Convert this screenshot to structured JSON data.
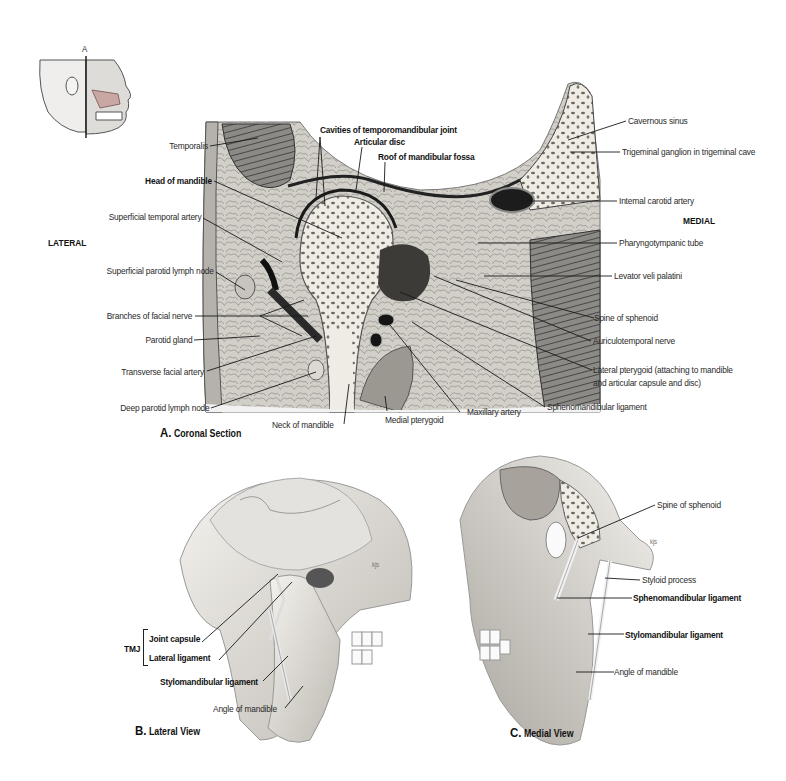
{
  "orientation_figure": {
    "plane_label": "A"
  },
  "panel_a": {
    "caption_letter": "A.",
    "caption_text": "Coronal Section",
    "side_labels": {
      "lateral": "LATERAL",
      "medial": "MEDIAL"
    },
    "labels_left": [
      {
        "text": "Temporalis",
        "bold": false
      },
      {
        "text": "Head of mandible",
        "bold": true
      },
      {
        "text": "Superficial temporal artery",
        "bold": false
      },
      {
        "text": "Superficial parotid lymph node",
        "bold": false
      },
      {
        "text": "Branches of facial nerve",
        "bold": false
      },
      {
        "text": "Parotid gland",
        "bold": false
      },
      {
        "text": "Transverse facial artery",
        "bold": false
      },
      {
        "text": "Deep parotid lymph node",
        "bold": false
      }
    ],
    "labels_top": [
      {
        "text": "Cavities of temporomandibular joint",
        "bold": true
      },
      {
        "text": "Articular disc",
        "bold": true
      },
      {
        "text": "Roof of mandibular fossa",
        "bold": true
      }
    ],
    "labels_right": [
      {
        "text": "Cavernous sinus",
        "bold": false
      },
      {
        "text": "Trigeminal ganglion in trigeminal cave",
        "bold": false
      },
      {
        "text": "Internal carotid artery",
        "bold": false
      },
      {
        "text": "Pharyngotympanic tube",
        "bold": false
      },
      {
        "text": "Levator veli palatini",
        "bold": false
      },
      {
        "text": "Spine of sphenoid",
        "bold": false
      },
      {
        "text": "Auriculotemporal nerve",
        "bold": false
      },
      {
        "text": "Lateral pterygoid (attaching to mandible",
        "bold": false
      },
      {
        "text": "and articular capsule and disc)",
        "bold": false
      },
      {
        "text": "Sphenomandibular ligament",
        "bold": false
      }
    ],
    "labels_bottom": [
      {
        "text": "Neck of mandible",
        "bold": false
      },
      {
        "text": "Medial pterygoid",
        "bold": false
      },
      {
        "text": "Maxillary artery",
        "bold": false
      }
    ]
  },
  "panel_b": {
    "caption_letter": "B.",
    "caption_text": "Lateral View",
    "group_label": "TMJ",
    "labels": [
      {
        "text": "Joint capsule",
        "bold": true
      },
      {
        "text": "Lateral ligament",
        "bold": true
      },
      {
        "text": "Stylomandibular ligament",
        "bold": true
      },
      {
        "text": "Angle of mandible",
        "bold": false
      }
    ],
    "artist_signature": "kjs"
  },
  "panel_c": {
    "caption_letter": "C.",
    "caption_text": "Medial View",
    "labels": [
      {
        "text": "Spine of sphenoid",
        "bold": false
      },
      {
        "text": "Styloid process",
        "bold": false
      },
      {
        "text": "Sphenomandibular ligament",
        "bold": true
      },
      {
        "text": "Stylomandibular ligament",
        "bold": true
      },
      {
        "text": "Angle of mandible",
        "bold": false
      }
    ],
    "artist_signature": "kjs"
  },
  "colors": {
    "text": "#222222",
    "bone": "#ece8e0",
    "tissue": "#b8b4ae",
    "dark_tissue": "#3a3a3a",
    "leader": "#1a1a1a"
  }
}
